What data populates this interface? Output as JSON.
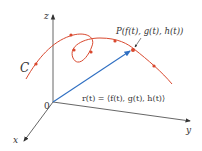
{
  "diagram": {
    "axes": {
      "z_label": "z",
      "y_label": "y",
      "x_label": "x",
      "origin_label": "0"
    },
    "curve": {
      "label": "C",
      "color": "#d9492f"
    },
    "point": {
      "label": "P(f(t), g(t), h(t))"
    },
    "vector": {
      "label": "r(t) = ⟨f(t), g(t), h(t)⟩",
      "color": "#2f6fc2"
    },
    "colors": {
      "axis": "#444444",
      "curve": "#d9492f",
      "vector": "#2f6fc2"
    }
  }
}
